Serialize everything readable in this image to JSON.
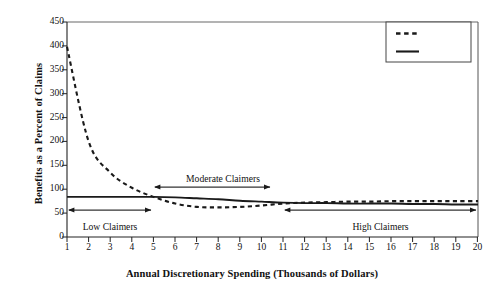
{
  "chart_data": {
    "type": "line",
    "title": "",
    "xlabel": "Annual Discretionary Spending (Thousands of Dollars)",
    "ylabel": "Benefits as a Percent of Claims",
    "xlim": [
      1,
      20
    ],
    "ylim": [
      0,
      450
    ],
    "ytick_labels": [
      "0",
      "50",
      "100",
      "150",
      "200",
      "250",
      "300",
      "350",
      "400",
      "450"
    ],
    "ytick_values": [
      0,
      50,
      100,
      150,
      200,
      250,
      300,
      350,
      400,
      450
    ],
    "xtick_labels": [
      "1",
      "2",
      "3",
      "4",
      "5",
      "6",
      "7",
      "8",
      "9",
      "10",
      "11",
      "12",
      "13",
      "14",
      "15",
      "16",
      "17",
      "18",
      "19",
      "20"
    ],
    "xtick_values": [
      1,
      2,
      3,
      4,
      5,
      6,
      7,
      8,
      9,
      10,
      11,
      12,
      13,
      14,
      15,
      16,
      17,
      18,
      19,
      20
    ],
    "grid": false,
    "legend_position": "top-right",
    "x": [
      1,
      2,
      3,
      4,
      5,
      6,
      7,
      8,
      9,
      10,
      11,
      12,
      13,
      14,
      15,
      16,
      17,
      18,
      19,
      20
    ],
    "series": [
      {
        "name": "MSA",
        "style": "dashed",
        "color": "#1a1a1a",
        "values": [
          398,
          200,
          135,
          103,
          84,
          70,
          63,
          62,
          63,
          66,
          70,
          72,
          73,
          74,
          74,
          75,
          75,
          75,
          75,
          75
        ]
      },
      {
        "name": "Non-MSA",
        "style": "solid",
        "color": "#1a1a1a",
        "values": [
          84,
          84,
          84,
          84,
          84,
          83,
          81,
          79,
          76,
          74,
          72,
          71,
          71,
          70,
          70,
          70,
          69,
          69,
          68,
          68
        ]
      }
    ],
    "annotations": [
      {
        "label": "Low Claimers",
        "x_start": 1,
        "x_end": 5,
        "arrow": "double",
        "text_position": "below"
      },
      {
        "label": "Moderate Claimers",
        "x_start": 5,
        "x_end": 10.4,
        "arrow": "double",
        "text_position": "above"
      },
      {
        "label": "High Claimers",
        "x_start": 11,
        "x_end": 20,
        "arrow": "double",
        "text_position": "below"
      }
    ]
  },
  "legend": {
    "entries": [
      {
        "label": "MSA",
        "style": "dashed"
      },
      {
        "label": "Non-MSA",
        "style": "solid"
      }
    ]
  },
  "axis": {
    "y_title": "Benefits as a Percent of Claims",
    "x_title": "Annual Discretionary Spending (Thousands of Dollars)"
  }
}
